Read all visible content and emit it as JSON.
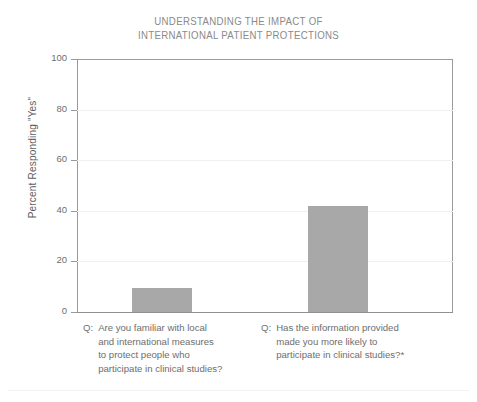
{
  "chart_data": {
    "type": "bar",
    "title": "UNDERSTANDING THE IMPACT OF INTERNATIONAL PATIENT PROTECTIONS",
    "title_lines": [
      "UNDERSTANDING THE IMPACT OF",
      "INTERNATIONAL PATIENT PROTECTIONS"
    ],
    "xlabel": "",
    "ylabel": "Percent Responding \"Yes\"",
    "ylim": [
      0,
      100
    ],
    "ytick_labels": [
      "0",
      "20",
      "40",
      "60",
      "80",
      "100"
    ],
    "ytick_values": [
      0,
      20,
      40,
      60,
      80,
      100
    ],
    "grid": true,
    "legend": false,
    "bar_color": "#a8a8a8",
    "categories": [
      "Q: Are you familiar with local and international measures to protect people who participate in clinical studies?",
      "Q: Has the information provided made you more likely to participate in clinical studies?*"
    ],
    "values": [
      9.5,
      42
    ],
    "category_label_lines": [
      {
        "prefix": "Q:",
        "lines": [
          "Are you familiar with local",
          "and international measures",
          "to protect people who",
          "participate in clinical studies?"
        ]
      },
      {
        "prefix": "Q:",
        "lines": [
          "Has the information provided",
          "made you more likely to",
          "participate in clinical studies?*"
        ]
      }
    ]
  }
}
